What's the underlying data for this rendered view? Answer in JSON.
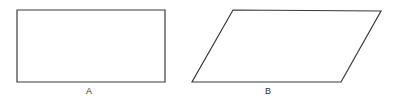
{
  "diagram": {
    "stroke_color": "#3a3a3a",
    "shapes": [
      {
        "id": "A",
        "kind": "rectangle",
        "label": "A",
        "points": [
          [
            17,
            10
          ],
          [
            165,
            10
          ],
          [
            165,
            82
          ],
          [
            17,
            82
          ]
        ]
      },
      {
        "id": "B",
        "kind": "parallelogram",
        "label": "B",
        "points": [
          [
            233,
            10
          ],
          [
            381,
            11
          ],
          [
            341,
            82
          ],
          [
            192,
            82
          ]
        ]
      }
    ]
  }
}
